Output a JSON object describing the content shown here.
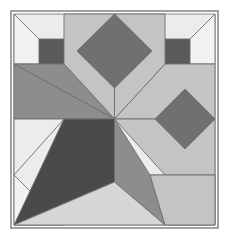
{
  "artwork": {
    "title": "Geometric quilt block pattern",
    "type": "eight-point-star-quilt-block",
    "canvas": {
      "width": 228,
      "height": 239,
      "background": "#ffffff"
    },
    "frame": {
      "x": 11,
      "y": 11,
      "width": 207,
      "height": 217,
      "border_color": "#8a8a8a",
      "border_width": 1.6
    },
    "palette": {
      "background_light": "#ececec",
      "petal_light": "#c4c4c4",
      "petal_mid": "#9a9a9a",
      "petal_medium_gray": "#808080",
      "accent_dark": "#5a5a5a",
      "accent_darkest": "#4a4a4a",
      "outline": "#6e6e6e"
    },
    "geometry": {
      "center": {
        "x": 114.5,
        "y": 119.0
      },
      "frame_left": 14,
      "frame_top": 14,
      "frame_right": 215,
      "frame_bottom": 225,
      "band_left": 64,
      "band_right": 165,
      "band_top": 64,
      "band_bottom": 175
    },
    "patches": [
      {
        "name": "background-field",
        "fill": "#ececec",
        "stroke": "#6e6e6e",
        "stroke_width": 0.8,
        "points": "14,14 215,14 215,225 14,225"
      },
      {
        "name": "corner-diagonal-top-left",
        "fill": "#f2f2f2",
        "stroke": "#6e6e6e",
        "stroke_width": 0.9,
        "points": "14,14 64,64 14,64"
      },
      {
        "name": "corner-diagonal-top-right",
        "fill": "#f2f2f2",
        "stroke": "#6e6e6e",
        "stroke_width": 0.9,
        "points": "215,14 215,64 165,64"
      },
      {
        "name": "corner-diagonal-bottom-right",
        "fill": "#f2f2f2",
        "stroke": "#6e6e6e",
        "stroke_width": 0.9,
        "points": "215,225 165,225 215,175"
      },
      {
        "name": "corner-diagonal-bottom-left",
        "fill": "#f2f2f2",
        "stroke": "#6e6e6e",
        "stroke_width": 0.9,
        "points": "14,225 14,175 64,225"
      },
      {
        "name": "corner-square-top-left",
        "fill": "#5a5a5a",
        "stroke": "#6e6e6e",
        "stroke_width": 0.9,
        "points": "39,39 64,39 64,64 39,64"
      },
      {
        "name": "corner-square-top-right",
        "fill": "#5a5a5a",
        "stroke": "#6e6e6e",
        "stroke_width": 0.9,
        "points": "165,39 190,39 190,64 165,64"
      },
      {
        "name": "corner-square-bottom-right",
        "fill": "#5a5a5a",
        "stroke": "#6e6e6e",
        "stroke_width": 0.9,
        "points": "150,175 190,175 190,200 150,200"
      },
      {
        "name": "petal-north-left",
        "fill": "#c4c4c4",
        "stroke": "#6e6e6e",
        "stroke_width": 0.9,
        "points": "114.5,119 64,64 64,14 114.5,14"
      },
      {
        "name": "petal-north-right",
        "fill": "#c4c4c4",
        "stroke": "#6e6e6e",
        "stroke_width": 0.9,
        "points": "114.5,119 114.5,14 165,14 165,64"
      },
      {
        "name": "diamond-north-dark",
        "fill": "#707070",
        "stroke": "#6e6e6e",
        "stroke_width": 0.9,
        "points": "114.5,14 152,51 114.5,88 77,51"
      },
      {
        "name": "petal-east-upper",
        "fill": "#c4c4c4",
        "stroke": "#6e6e6e",
        "stroke_width": 0.9,
        "points": "114.5,119 165,64 215,64 215,119"
      },
      {
        "name": "petal-east-lower",
        "fill": "#c4c4c4",
        "stroke": "#6e6e6e",
        "stroke_width": 0.9,
        "points": "114.5,119 215,119 215,175 165,175"
      },
      {
        "name": "diamond-east-dark",
        "fill": "#707070",
        "stroke": "#6e6e6e",
        "stroke_width": 0.9,
        "points": "215,119 185,89 155,119 185,149"
      },
      {
        "name": "petal-west-upper",
        "fill": "#8d8d8d",
        "stroke": "#6e6e6e",
        "stroke_width": 0.9,
        "points": "114.5,119 14,64 64,64 114.5,119"
      },
      {
        "name": "petal-west-wedge",
        "fill": "#8d8d8d",
        "stroke": "#6e6e6e",
        "stroke_width": 0.9,
        "points": "14,64 114.5,119 64,119 14,119"
      },
      {
        "name": "petal-west-lower-light",
        "fill": "#ececec",
        "stroke": "#6e6e6e",
        "stroke_width": 0.9,
        "points": "14,119 64,119 14,175"
      },
      {
        "name": "petal-southwest-dark",
        "fill": "#4a4a4a",
        "stroke": "#6e6e6e",
        "stroke_width": 0.9,
        "points": "114.5,119 64,119 14,225 114.5,182"
      },
      {
        "name": "petal-south-mid",
        "fill": "#8d8d8d",
        "stroke": "#6e6e6e",
        "stroke_width": 0.9,
        "points": "114.5,119 114.5,182 165,225 150,175"
      },
      {
        "name": "petal-south-light",
        "fill": "#d6d6d6",
        "stroke": "#6e6e6e",
        "stroke_width": 0.9,
        "points": "14,225 114.5,182 165,225"
      },
      {
        "name": "petal-southeast-band",
        "fill": "#c4c4c4",
        "stroke": "#6e6e6e",
        "stroke_width": 0.9,
        "points": "150,175 165,225 215,225 215,175"
      }
    ]
  }
}
